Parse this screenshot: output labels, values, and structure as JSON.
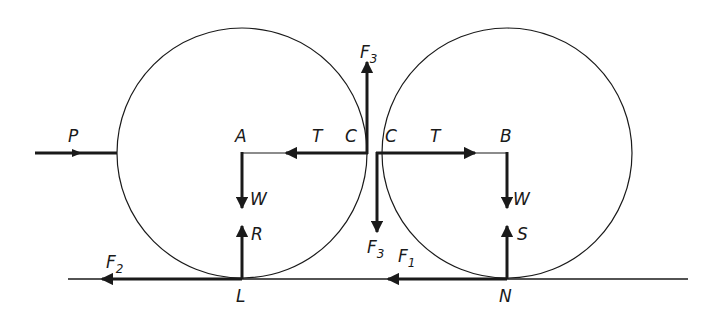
{
  "diagram": {
    "colors": {
      "ink": "#1a1a1a",
      "background": "#ffffff"
    },
    "cylinders": [
      {
        "id": "left",
        "center_label": "A",
        "contact_ground_label": "L"
      },
      {
        "id": "right",
        "center_label": "B",
        "contact_ground_label": "N"
      }
    ],
    "labels": {
      "P": "P",
      "A": "A",
      "T_left": "T",
      "C_left": "C",
      "C_right": "C",
      "T_right": "T",
      "B": "B",
      "F3_top": "F",
      "F3_top_sub": "3",
      "F3_bottom": "F",
      "F3_bottom_sub": "3",
      "W_left": "W",
      "W_right": "W",
      "R": "R",
      "S": "S",
      "F1": "F",
      "F1_sub": "1",
      "F2": "F",
      "F2_sub": "2",
      "L": "L",
      "N": "N"
    },
    "forces": [
      {
        "name": "P",
        "on": "left",
        "direction": "right"
      },
      {
        "name": "T",
        "on": "left",
        "direction": "left"
      },
      {
        "name": "T",
        "on": "right",
        "direction": "right"
      },
      {
        "name": "F3",
        "on": "left",
        "direction": "up"
      },
      {
        "name": "F3",
        "on": "right",
        "direction": "down"
      },
      {
        "name": "W",
        "on": "left",
        "direction": "down"
      },
      {
        "name": "W",
        "on": "right",
        "direction": "down"
      },
      {
        "name": "R",
        "on": "left",
        "direction": "up"
      },
      {
        "name": "S",
        "on": "right",
        "direction": "up"
      },
      {
        "name": "F2",
        "on": "left",
        "direction": "left"
      },
      {
        "name": "F1",
        "on": "right",
        "direction": "left"
      }
    ]
  }
}
